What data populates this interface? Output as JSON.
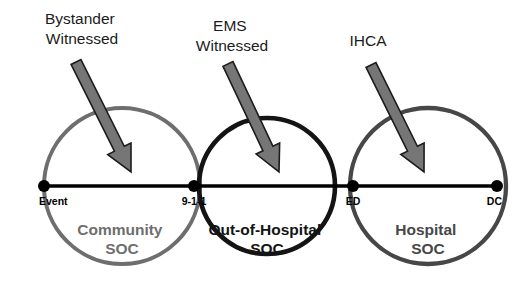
{
  "diagram": {
    "background_color": "#ffffff",
    "timeline": {
      "axis_color": "#000000",
      "start_x": 44,
      "end_x": 497,
      "y": 186,
      "milestones": [
        {
          "id": "event",
          "label": "Event",
          "x": 44,
          "anchor": "start"
        },
        {
          "id": "911",
          "label": "9-1-1",
          "x": 194,
          "anchor": "middle"
        },
        {
          "id": "ed",
          "label": "ED",
          "x": 353,
          "anchor": "middle"
        },
        {
          "id": "dc",
          "label": "DC",
          "x": 497,
          "anchor": "end"
        }
      ]
    },
    "zones": [
      {
        "id": "community",
        "line1": "Community",
        "line2": "SOC",
        "color": "#6e6e6e",
        "cx": 122,
        "cy": 186,
        "r": 78,
        "label_x": 122,
        "label_y": 235
      },
      {
        "id": "out-of-hospital",
        "line1": "Out-of-Hospital",
        "line2": "SOC",
        "color": "#141414",
        "cx": 267,
        "cy": 186,
        "r": 68,
        "label_x": 267,
        "label_y": 235
      },
      {
        "id": "hospital",
        "line1": "Hospital",
        "line2": "SOC",
        "color": "#474747",
        "cx": 428,
        "cy": 186,
        "r": 78,
        "label_x": 428,
        "label_y": 235
      }
    ],
    "callouts": [
      {
        "id": "bystander-witnessed",
        "line1": "Bystander",
        "line2": "Witnessed",
        "label_x": 82,
        "label_y1": 24,
        "label_y2": 44,
        "arrow_x1": 76,
        "arrow_y1": 62,
        "arrow_x2": 131,
        "arrow_y2": 172
      },
      {
        "id": "ems-witnessed",
        "line1": "EMS",
        "line2": "Witnessed",
        "label_x": 232,
        "label_y1": 31,
        "label_y2": 51,
        "arrow_x1": 228,
        "arrow_y1": 64,
        "arrow_x2": 279,
        "arrow_y2": 172
      },
      {
        "id": "ihca",
        "line1": "IHCA",
        "line2": "",
        "label_x": 368,
        "label_y1": 46,
        "label_y2": 46,
        "arrow_x1": 371,
        "arrow_y1": 65,
        "arrow_x2": 424,
        "arrow_y2": 172
      }
    ],
    "arrow_style": {
      "fill": "#767676",
      "stroke": "#1c1c1c",
      "shaft_width": 11,
      "head_width": 26,
      "head_length": 26
    }
  }
}
